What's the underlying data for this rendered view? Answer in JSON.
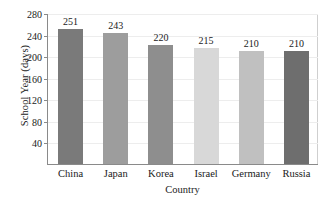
{
  "chart_data": {
    "type": "bar",
    "title": "",
    "xlabel": "Country",
    "ylabel": "School Year (days)",
    "categories": [
      "China",
      "Japan",
      "Korea",
      "Israel",
      "Germany",
      "Russia"
    ],
    "values": [
      251,
      243,
      220,
      215,
      210,
      210
    ],
    "value_labels": [
      "251",
      "243",
      "220",
      "215",
      "210",
      "210"
    ],
    "ylim": [
      0,
      280
    ],
    "yticks": [
      280,
      240,
      200,
      160,
      120,
      80,
      40
    ],
    "ytick_labels": [
      "280",
      "240",
      "200",
      "160",
      "120",
      "80",
      "40"
    ],
    "grid": true,
    "legend": "none",
    "bar_colors": [
      "#7a7a7a",
      "#9d9d9d",
      "#8e8e8e",
      "#d8d8d8",
      "#c0c0c0",
      "#6e6e6e"
    ],
    "axis_color": "#8a8a8a",
    "gridline_color": "#ededed",
    "background": "#ffffff"
  }
}
